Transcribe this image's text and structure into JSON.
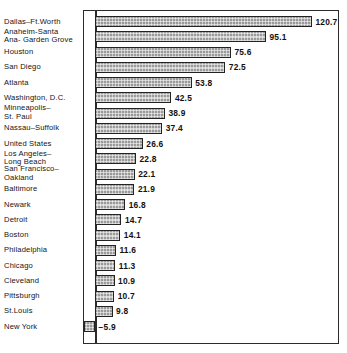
{
  "chart_data": {
    "type": "bar",
    "orientation": "horizontal",
    "title": "",
    "subtitle": "",
    "xlabel": "",
    "ylabel": "",
    "xlim": [
      -10,
      130
    ],
    "grid": false,
    "legend": null,
    "axis_zero_line": true,
    "value_label_format": "one-decimal",
    "categories": [
      "Dallas–Ft.Worth",
      "Anaheim-Santa\nAna- Garden Grove",
      "Houston",
      "San Diego",
      "Atlanta",
      "Washington, D.C.",
      "Minneapolis–\nSt. Paul",
      "Nassau–Suffolk",
      "United States",
      "Los Angeles–\nLong Beach",
      "San Francisco–\nOakland",
      "Baltimore",
      "Newark",
      "Detroit",
      "Boston",
      "Philadelphia",
      "Chicago",
      "Cleveland",
      "Pittsburgh",
      "St.Louis",
      "New York"
    ],
    "values": [
      120.7,
      95.1,
      75.6,
      72.5,
      53.8,
      42.5,
      38.9,
      37.4,
      26.6,
      22.8,
      22.1,
      21.9,
      16.8,
      14.7,
      14.1,
      11.6,
      11.3,
      10.9,
      10.7,
      9.8,
      -5.9
    ],
    "value_labels": [
      "120.7",
      "95.1",
      "75.6",
      "72.5",
      "53.8",
      "42.5",
      "38.9",
      "37.4",
      "26.6",
      "22.8",
      "22.1",
      "21.9",
      "16.8",
      "14.7",
      "14.1",
      "11.6",
      "11.3",
      "10.9",
      "10.7",
      "9.8",
      "−5.9"
    ],
    "colors": {
      "bar_fill": "#9a9a9a",
      "bar_border": "#232323",
      "frame": "#2b2b2b",
      "background": "#ffffff",
      "text": "#141414"
    }
  },
  "rows": [
    {
      "label": "Dallas–Ft.Worth",
      "value": 120.7,
      "value_label": "120.7",
      "top": 21,
      "sign": "positive"
    },
    {
      "label": "Anaheim-Santa\nAna- Garden Grove",
      "value": 95.1,
      "value_label": "95.1",
      "top": 36,
      "sign": "positive"
    },
    {
      "label": "Houston",
      "value": 75.6,
      "value_label": "75.6",
      "top": 51,
      "sign": "positive"
    },
    {
      "label": "San Diego",
      "value": 72.5,
      "value_label": "72.5",
      "top": 66,
      "sign": "positive"
    },
    {
      "label": "Atlanta",
      "value": 53.8,
      "value_label": "53.8",
      "top": 81,
      "sign": "positive"
    },
    {
      "label": "Washington, D.C.",
      "value": 42.5,
      "value_label": "42.5",
      "top": 98,
      "sign": "positive"
    },
    {
      "label": "Minneapolis–\nSt. Paul",
      "value": 38.9,
      "value_label": "38.9",
      "top": 114,
      "sign": "positive"
    },
    {
      "label": "Nassau–Suffolk",
      "value": 37.4,
      "value_label": "37.4",
      "top": 130,
      "sign": "positive"
    },
    {
      "label": "United States",
      "value": 26.6,
      "value_label": "26.6",
      "top": 148,
      "sign": "positive"
    },
    {
      "label": "Los Angeles–\nLong Beach",
      "value": 22.8,
      "value_label": "22.8",
      "top": 164,
      "sign": "positive"
    },
    {
      "label": "San Francisco–\nOakland",
      "value": 22.1,
      "value_label": "22.1",
      "top": 180,
      "sign": "positive"
    },
    {
      "label": "Baltimore",
      "value": 21.9,
      "value_label": "21.9",
      "top": 195,
      "sign": "positive"
    },
    {
      "label": "Newark",
      "value": 16.8,
      "value_label": "16.8",
      "top": 212,
      "sign": "positive"
    },
    {
      "label": "Detroit",
      "value": 14.7,
      "value_label": "14.7",
      "top": 231,
      "sign": "positive"
    },
    {
      "label": "Boston",
      "value": 14.1,
      "value_label": "14.1",
      "top": 250,
      "sign": "positive"
    },
    {
      "label": "Philadelphia",
      "value": 11.6,
      "value_label": "11.6",
      "top": 268,
      "sign": "positive"
    },
    {
      "label": "Chicago",
      "value": 11.3,
      "value_label": "11.3",
      "top": 287,
      "sign": "positive"
    },
    {
      "label": "Cleveland",
      "value": 10.9,
      "value_label": "10.9",
      "top": 306,
      "sign": "positive"
    },
    {
      "label": "Pittsburgh",
      "value": 10.7,
      "value_label": "10.7",
      "top": 321,
      "sign": "positive"
    },
    {
      "label": "St.Louis",
      "value": 9.8,
      "value_label": "9.8",
      "top": 336,
      "sign": "positive"
    },
    {
      "label": "New York",
      "value": -5.9,
      "value_label": "−5.9",
      "top": 353,
      "sign": "negative"
    }
  ]
}
